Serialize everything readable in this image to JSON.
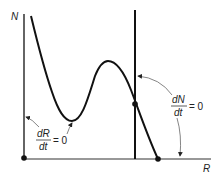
{
  "diagram": {
    "axes": {
      "y_label": "N",
      "x_label": "R"
    },
    "isoclines": {
      "prey": {
        "numerator": "dR",
        "denominator": "dt",
        "equals": "= 0",
        "description": "hump-shaped prey isocline"
      },
      "predator": {
        "numerator": "dN",
        "denominator": "dt",
        "equals": "= 0",
        "description": "vertical predator isocline"
      }
    },
    "points": [
      {
        "name": "origin",
        "x": 24,
        "y": 158
      },
      {
        "name": "equilibrium",
        "x": 135,
        "y": 104
      },
      {
        "name": "carrying-capacity",
        "x": 158,
        "y": 159
      }
    ],
    "colors": {
      "line": "#111111",
      "arrow": "#666666"
    }
  }
}
